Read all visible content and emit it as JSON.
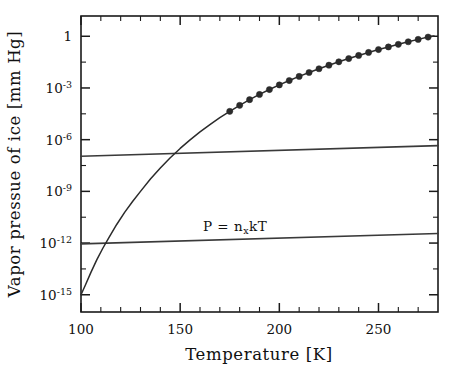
{
  "figure": {
    "background_color": "#ffffff",
    "foreground_color": "#1a1a1a"
  },
  "axes": {
    "x": {
      "title": "Temperature [K]",
      "tick_labels": [
        "100",
        "150",
        "200",
        "250"
      ],
      "tick_values": [
        100,
        150,
        200,
        250
      ],
      "range": [
        100,
        280
      ],
      "minor_tick_step": 10
    },
    "y": {
      "title": "Vapor pressue of ice [mm Hg]",
      "tick_labels": [
        "1",
        "10",
        "10",
        "10",
        "10",
        "10"
      ],
      "tick_exponents": [
        "",
        "-3",
        "-6",
        "-9",
        "-12",
        "-15"
      ],
      "tick_values": [
        0,
        -3,
        -6,
        -9,
        -12,
        -15
      ],
      "range": [
        -16,
        1.2
      ],
      "minor_decade_step": 1
    }
  },
  "annotations": [
    {
      "id": "equation-label",
      "base": "P  =  n",
      "sub": "x",
      "tail": "kT",
      "x": 203,
      "y": 231
    }
  ],
  "chart_data": {
    "type": "line",
    "title": "",
    "xlabel": "Temperature [K]",
    "ylabel": "Vapor pressue of ice [mm Hg]",
    "xlim": [
      100,
      280
    ],
    "ylim": [
      1e-16,
      15
    ],
    "yscale": "log",
    "xscale": "linear",
    "grid": false,
    "legend": "none",
    "annotation_text": "P = n_x kT",
    "series": [
      {
        "name": "vapor-pressure-of-ice",
        "style": "line+markers",
        "marker": "filled-circle",
        "x": [
          100,
          102,
          105,
          108,
          111,
          114,
          118,
          122,
          126,
          130,
          135,
          140,
          145,
          150,
          155,
          160,
          165,
          170,
          175,
          180,
          185,
          190,
          195,
          200,
          205,
          210,
          215,
          220,
          225,
          230,
          235,
          240,
          245,
          250,
          255,
          260,
          265,
          270,
          275,
          278
        ],
        "y": [
          1e-15,
          3.2e-15,
          2e-14,
          1.1e-13,
          5e-13,
          2e-12,
          1.2e-11,
          6e-11,
          2.6e-10,
          1e-09,
          5.2e-09,
          2.3e-08,
          9e-08,
          3.1e-07,
          9.8e-07,
          2.8e-06,
          7.5e-06,
          1.9e-05,
          4.4e-05,
          9.8e-05,
          0.00021,
          0.00042,
          0.00081,
          0.0015,
          0.0027,
          0.0047,
          0.0079,
          0.013,
          0.021,
          0.033,
          0.051,
          0.077,
          0.115,
          0.17,
          0.24,
          0.34,
          0.48,
          0.66,
          0.9,
          1.05
        ],
        "marker_x": [
          175,
          180,
          185,
          190,
          195,
          200,
          205,
          210,
          215,
          220,
          225,
          230,
          235,
          240,
          245,
          250,
          255,
          260,
          265,
          270,
          275
        ],
        "marker_y": [
          4.4e-05,
          9.8e-05,
          0.00021,
          0.00042,
          0.00081,
          0.0015,
          0.0027,
          0.0047,
          0.0079,
          0.013,
          0.021,
          0.033,
          0.051,
          0.077,
          0.115,
          0.17,
          0.24,
          0.34,
          0.48,
          0.66,
          0.9
        ]
      },
      {
        "name": "upper-partial-pressure-line",
        "style": "line",
        "x": [
          100,
          280
        ],
        "y": [
          1.1e-07,
          4.5e-07
        ]
      },
      {
        "name": "lower-partial-pressure-line",
        "style": "line",
        "x": [
          100,
          280
        ],
        "y": [
          9e-13,
          3.6e-12
        ]
      }
    ]
  }
}
